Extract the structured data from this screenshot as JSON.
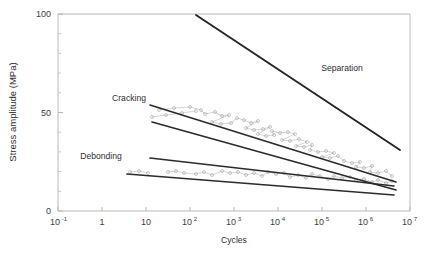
{
  "chart_data": {
    "type": "scatter",
    "title": "",
    "xlabel": "Cycles",
    "ylabel": "Stress amplitude (MPa)",
    "xscale": "log",
    "yscale": "linear",
    "xlim": [
      0.1,
      10000000
    ],
    "ylim": [
      0,
      100
    ],
    "xticks": [
      {
        "value": 0.1,
        "base": "10",
        "exp": "-1"
      },
      {
        "value": 1,
        "base": "1",
        "exp": ""
      },
      {
        "value": 10,
        "base": "10",
        "exp": ""
      },
      {
        "value": 100,
        "base": "10",
        "exp": "2"
      },
      {
        "value": 1000,
        "base": "10",
        "exp": "3"
      },
      {
        "value": 10000,
        "base": "10",
        "exp": "4"
      },
      {
        "value": 100000,
        "base": "10",
        "exp": "5"
      },
      {
        "value": 1000000,
        "base": "10",
        "exp": "6"
      },
      {
        "value": 10000000,
        "base": "10",
        "exp": "7"
      }
    ],
    "yticks_major": [
      0,
      50,
      100
    ],
    "yticks_minor": [
      10,
      20,
      30,
      40,
      60,
      70,
      80,
      90
    ],
    "grid": false,
    "legend": "none",
    "annotations": [
      {
        "label": "Separation",
        "x_px": 342,
        "y_px": 71
      },
      {
        "label": "Cracking",
        "x_px": 129,
        "y_px": 101
      },
      {
        "label": "Debonding",
        "x_px": 101,
        "y_px": 159
      }
    ],
    "bands": [
      {
        "name": "Separation",
        "kind": "single-line",
        "color": "#242424",
        "points": [
          [
            196,
            15
          ],
          [
            400,
            150
          ]
        ]
      },
      {
        "name": "Cracking",
        "kind": "band",
        "color": "#2b2b2b",
        "upper": [
          [
            150,
            105
          ],
          [
            396,
            182
          ]
        ],
        "lower": [
          [
            152,
            122
          ],
          [
            396,
            190
          ]
        ]
      },
      {
        "name": "Debonding",
        "kind": "band",
        "color": "#2b2b2b",
        "upper": [
          [
            150,
            158
          ],
          [
            394,
            186
          ]
        ],
        "lower": [
          [
            127,
            174
          ],
          [
            394,
            195
          ]
        ]
      }
    ],
    "series": [
      {
        "name": "Cracking data",
        "marker": "open-circle",
        "color": "#9a9a9a",
        "points": [
          [
            152,
            117
          ],
          [
            166,
            115
          ],
          [
            182,
            113
          ],
          [
            196,
            111
          ],
          [
            159,
            110
          ],
          [
            174,
            108
          ],
          [
            190,
            107
          ],
          [
            201,
            110
          ],
          [
            205,
            114
          ],
          [
            215,
            112
          ],
          [
            222,
            116
          ],
          [
            229,
            115
          ],
          [
            212,
            122
          ],
          [
            221,
            124
          ],
          [
            231,
            123
          ],
          [
            237,
            118
          ],
          [
            244,
            120
          ],
          [
            251,
            123
          ],
          [
            258,
            121
          ],
          [
            246,
            128
          ],
          [
            254,
            130
          ],
          [
            263,
            129
          ],
          [
            270,
            127
          ],
          [
            258,
            134
          ],
          [
            266,
            136
          ],
          [
            274,
            135
          ],
          [
            272,
            131
          ],
          [
            280,
            133
          ],
          [
            288,
            132
          ],
          [
            295,
            134
          ],
          [
            282,
            140
          ],
          [
            290,
            141
          ],
          [
            299,
            139
          ],
          [
            307,
            142
          ],
          [
            296,
            146
          ],
          [
            304,
            147
          ],
          [
            312,
            145
          ],
          [
            310,
            150
          ],
          [
            318,
            152
          ],
          [
            326,
            151
          ],
          [
            334,
            153
          ],
          [
            322,
            157
          ],
          [
            330,
            158
          ],
          [
            338,
            156
          ],
          [
            344,
            161
          ],
          [
            352,
            163
          ],
          [
            360,
            162
          ],
          [
            356,
            167
          ],
          [
            364,
            168
          ],
          [
            372,
            166
          ],
          [
            370,
            172
          ],
          [
            378,
            173
          ],
          [
            386,
            171
          ],
          [
            392,
            176
          ]
        ]
      },
      {
        "name": "Debonding data",
        "marker": "open-circle",
        "color": "#9a9a9a",
        "points": [
          [
            130,
            172
          ],
          [
            139,
            171
          ],
          [
            148,
            173
          ],
          [
            168,
            172
          ],
          [
            176,
            171
          ],
          [
            184,
            173
          ],
          [
            196,
            174
          ],
          [
            204,
            172
          ],
          [
            212,
            175
          ],
          [
            222,
            171
          ],
          [
            230,
            173
          ],
          [
            238,
            172
          ],
          [
            246,
            175
          ],
          [
            254,
            173
          ],
          [
            262,
            176
          ],
          [
            268,
            172
          ],
          [
            276,
            174
          ],
          [
            284,
            173
          ],
          [
            290,
            177
          ],
          [
            298,
            175
          ],
          [
            306,
            178
          ],
          [
            312,
            174
          ],
          [
            320,
            176
          ],
          [
            328,
            179
          ],
          [
            334,
            176
          ],
          [
            342,
            178
          ],
          [
            350,
            177
          ],
          [
            356,
            180
          ],
          [
            364,
            179
          ],
          [
            372,
            182
          ],
          [
            378,
            180
          ],
          [
            386,
            183
          ],
          [
            392,
            181
          ]
        ]
      }
    ]
  },
  "axes": {
    "frame_left_px": 58,
    "frame_right_px": 410,
    "frame_top_px": 14,
    "frame_bottom_px": 211
  }
}
